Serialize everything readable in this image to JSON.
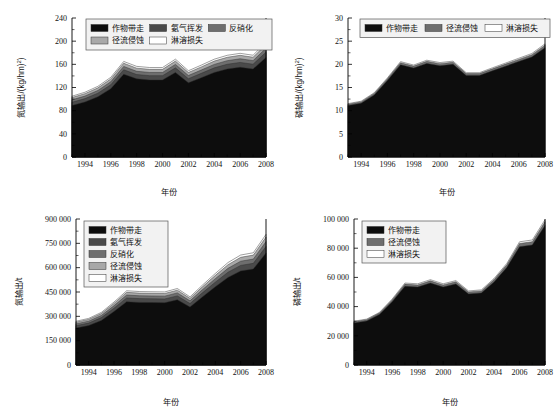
{
  "figure": {
    "panels": [
      "top-left",
      "top-right",
      "bottom-left",
      "bottom-right"
    ],
    "shared_xlabel": "年份"
  },
  "colors": {
    "crop_removal": "#0d0d0d",
    "ammonia_volatilization": "#4a4a4a",
    "denitrification": "#6e6e6e",
    "runoff_erosion": "#a8a8a8",
    "leaching_loss": "#ffffff",
    "axis": "#000000",
    "legend_bg": "#f2f2f2"
  },
  "chart_data": [
    {
      "id": "nitrogen-intensity",
      "type": "area",
      "stacked": true,
      "title": "",
      "xlabel": "年份",
      "ylabel": "氮输出/(kg/hm2)",
      "ylabel_display": "氮输出/(kg/hm²)",
      "x": [
        1993,
        1994,
        1995,
        1996,
        1997,
        1998,
        1999,
        2000,
        2001,
        2002,
        2003,
        2004,
        2005,
        2006,
        2007,
        2008
      ],
      "xlim": [
        1993,
        2008
      ],
      "ylim": [
        0,
        240
      ],
      "yticks": [
        0,
        40,
        80,
        120,
        160,
        200,
        240
      ],
      "xticks": [
        1994,
        1996,
        1998,
        2000,
        2002,
        2004,
        2006,
        2008
      ],
      "grid": false,
      "legend_position": "top-center",
      "series": [
        {
          "name": "作物带走",
          "color": "#0d0d0d",
          "values": [
            89,
            95,
            104,
            118,
            143,
            135,
            133,
            133,
            146,
            128,
            137,
            146,
            152,
            155,
            152,
            172
          ]
        },
        {
          "name": "氨气挥发",
          "color": "#4a4a4a",
          "values": [
            5.5,
            5.8,
            6.2,
            6.8,
            7.6,
            7.4,
            7.4,
            7.4,
            7.9,
            7.2,
            7.5,
            7.9,
            8.1,
            8.3,
            8.2,
            8.9
          ]
        },
        {
          "name": "反硝化",
          "color": "#6e6e6e",
          "values": [
            4.2,
            4.4,
            4.7,
            5.1,
            5.8,
            5.6,
            5.6,
            5.6,
            6.0,
            5.5,
            5.7,
            6.0,
            6.2,
            6.3,
            6.2,
            6.8
          ]
        },
        {
          "name": "径流侵蚀",
          "color": "#a8a8a8",
          "values": [
            4.0,
            4.2,
            4.5,
            4.9,
            5.5,
            5.4,
            5.4,
            5.4,
            5.7,
            5.2,
            5.4,
            5.7,
            5.9,
            6.0,
            5.9,
            6.5
          ]
        },
        {
          "name": "淋溶损失",
          "color": "#ffffff",
          "values": [
            2.3,
            2.4,
            2.6,
            2.8,
            3.1,
            3.1,
            3.1,
            3.1,
            3.3,
            3.0,
            3.1,
            3.3,
            3.4,
            3.4,
            3.4,
            3.8
          ]
        }
      ],
      "legend": [
        {
          "label": "作物带走",
          "color": "#0d0d0d"
        },
        {
          "label": "氨气挥发",
          "color": "#4a4a4a"
        },
        {
          "label": "反硝化",
          "color": "#6e6e6e"
        },
        {
          "label": "径流侵蚀",
          "color": "#a8a8a8"
        },
        {
          "label": "淋溶损失",
          "color": "#ffffff"
        }
      ]
    },
    {
      "id": "phosphorus-intensity",
      "type": "area",
      "stacked": true,
      "title": "",
      "xlabel": "年份",
      "ylabel": "磷输出/(kg/hm2)",
      "ylabel_display": "磷输出/(kg/hm²)",
      "x": [
        1993,
        1994,
        1995,
        1996,
        1997,
        1998,
        1999,
        2000,
        2001,
        2002,
        2003,
        2004,
        2005,
        2006,
        2007,
        2008
      ],
      "xlim": [
        1993,
        2008
      ],
      "ylim": [
        0,
        30
      ],
      "yticks": [
        0,
        5,
        10,
        15,
        20,
        25,
        30
      ],
      "xticks": [
        1994,
        1996,
        1998,
        2000,
        2002,
        2004,
        2006,
        2008
      ],
      "grid": false,
      "legend_position": "top-center",
      "series": [
        {
          "name": "作物带走",
          "color": "#0d0d0d",
          "values": [
            11.1,
            11.6,
            13.4,
            16.5,
            19.9,
            19.2,
            20.2,
            19.7,
            20.0,
            17.6,
            17.6,
            18.6,
            19.6,
            20.6,
            21.6,
            23.6
          ]
        },
        {
          "name": "径流侵蚀",
          "color": "#6e6e6e",
          "values": [
            0.28,
            0.29,
            0.32,
            0.38,
            0.45,
            0.43,
            0.46,
            0.45,
            0.46,
            0.4,
            0.4,
            0.43,
            0.45,
            0.47,
            0.49,
            0.54
          ]
        },
        {
          "name": "淋溶损失",
          "color": "#ffffff",
          "values": [
            0.14,
            0.15,
            0.16,
            0.19,
            0.23,
            0.22,
            0.23,
            0.23,
            0.23,
            0.2,
            0.2,
            0.22,
            0.23,
            0.24,
            0.25,
            0.28
          ]
        }
      ],
      "legend": [
        {
          "label": "作物带走",
          "color": "#0d0d0d"
        },
        {
          "label": "径流侵蚀",
          "color": "#6e6e6e"
        },
        {
          "label": "淋溶损失",
          "color": "#ffffff"
        }
      ]
    },
    {
      "id": "nitrogen-total",
      "type": "area",
      "stacked": true,
      "title": "",
      "xlabel": "年份",
      "ylabel": "氮输出/t",
      "ylabel_display": "氮输出/t",
      "x": [
        1993,
        1994,
        1995,
        1996,
        1997,
        1998,
        1999,
        2000,
        2001,
        2002,
        2003,
        2004,
        2005,
        2006,
        2007,
        2008
      ],
      "xlim": [
        1993,
        2008
      ],
      "ylim": [
        0,
        900000
      ],
      "yticks": [
        0,
        150000,
        300000,
        450000,
        600000,
        750000,
        900000
      ],
      "yticklabels": [
        "0",
        "150 000",
        "300 000",
        "450 000",
        "600 000",
        "750 000",
        "900 000"
      ],
      "xticks": [
        1994,
        1996,
        1998,
        2000,
        2002,
        2004,
        2006,
        2008
      ],
      "grid": false,
      "legend_position": "top-left",
      "series": [
        {
          "name": "作物带走",
          "color": "#0d0d0d",
          "values": [
            228000,
            243000,
            275000,
            330000,
            390000,
            386000,
            385000,
            384000,
            402000,
            357000,
            421000,
            482000,
            540000,
            580000,
            592000,
            690000
          ]
        },
        {
          "name": "氨气挥发",
          "color": "#4a4a4a",
          "values": [
            14500,
            15400,
            17100,
            20200,
            23500,
            23200,
            23100,
            23000,
            24100,
            21800,
            25300,
            28600,
            31800,
            34000,
            34700,
            40000
          ]
        },
        {
          "name": "反硝化",
          "color": "#6e6e6e",
          "values": [
            11000,
            11700,
            13000,
            15300,
            17800,
            17600,
            17500,
            17500,
            18300,
            16600,
            19200,
            21700,
            24100,
            25800,
            26300,
            30300
          ]
        },
        {
          "name": "径流侵蚀",
          "color": "#a8a8a8",
          "values": [
            10300,
            10900,
            12100,
            14300,
            16600,
            16400,
            16400,
            16300,
            17100,
            15500,
            17900,
            20200,
            22500,
            24100,
            24600,
            28300
          ]
        },
        {
          "name": "淋溶损失",
          "color": "#ffffff",
          "values": [
            6000,
            6400,
            7100,
            8300,
            9700,
            9600,
            9500,
            9500,
            10000,
            9000,
            10400,
            11800,
            13100,
            14000,
            14300,
            16500
          ]
        }
      ],
      "legend": [
        {
          "label": "作物带走",
          "color": "#0d0d0d"
        },
        {
          "label": "氨气挥发",
          "color": "#4a4a4a"
        },
        {
          "label": "反硝化",
          "color": "#6e6e6e"
        },
        {
          "label": "径流侵蚀",
          "color": "#a8a8a8"
        },
        {
          "label": "淋溶损失",
          "color": "#ffffff"
        }
      ]
    },
    {
      "id": "phosphorus-total",
      "type": "area",
      "stacked": true,
      "title": "",
      "xlabel": "年份",
      "ylabel": "磷输出/t",
      "ylabel_display": "磷输出/t",
      "x": [
        1993,
        1994,
        1995,
        1996,
        1997,
        1998,
        1999,
        2000,
        2001,
        2002,
        2003,
        2004,
        2005,
        2006,
        2007,
        2008
      ],
      "xlim": [
        1993,
        2008
      ],
      "ylim": [
        0,
        100000
      ],
      "yticks": [
        0,
        20000,
        40000,
        60000,
        80000,
        100000
      ],
      "yticklabels": [
        "0",
        "20 000",
        "40 000",
        "60 000",
        "80 000",
        "100 000"
      ],
      "xticks": [
        1994,
        1996,
        1998,
        2000,
        2002,
        2004,
        2006,
        2008
      ],
      "grid": false,
      "legend_position": "top-left",
      "series": [
        {
          "name": "作物带走",
          "color": "#0d0d0d",
          "values": [
            28800,
            30200,
            34600,
            43400,
            53900,
            53400,
            56100,
            53400,
            55500,
            48700,
            49400,
            56900,
            66800,
            81000,
            82200,
            95500
          ]
        },
        {
          "name": "径流侵蚀",
          "color": "#6e6e6e",
          "values": [
            800,
            840,
            960,
            1200,
            1500,
            1480,
            1560,
            1480,
            1540,
            1350,
            1370,
            1580,
            1850,
            2250,
            2280,
            2650
          ]
        },
        {
          "name": "淋溶损失",
          "color": "#ffffff",
          "values": [
            400,
            420,
            480,
            600,
            750,
            740,
            780,
            740,
            770,
            680,
            690,
            790,
            930,
            1130,
            1150,
            1330
          ]
        }
      ],
      "legend": [
        {
          "label": "作物带走",
          "color": "#0d0d0d"
        },
        {
          "label": "径流侵蚀",
          "color": "#6e6e6e"
        },
        {
          "label": "淋溶损失",
          "color": "#ffffff"
        }
      ]
    }
  ]
}
